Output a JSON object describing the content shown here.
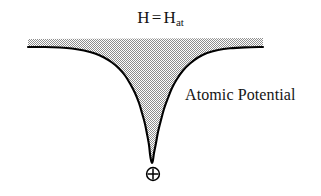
{
  "figure": {
    "title_field": {
      "lead": "H",
      "equals": "=",
      "symbol": "H",
      "subscript": "at",
      "full_text": "H = H(at)"
    },
    "annotation": {
      "label": "Atomic Potential"
    },
    "nucleus": {
      "glyph_name": "circled-plus",
      "glyph": "⊕",
      "meaning": "positive nucleus"
    },
    "colors": {
      "background": "#ffffff",
      "curve_stroke": "#000000",
      "fill_pattern": "#9a9a9a",
      "text": "#141414"
    }
  },
  "chart_data": {
    "type": "area",
    "xlabel": "",
    "ylabel": "",
    "annotations": [
      {
        "text": "Atomic Potential",
        "x": 185,
        "y": 95
      },
      {
        "text": "⊕",
        "x": 152,
        "y": 174
      }
    ],
    "grid": false,
    "legend": null,
    "xlim": [
      28,
      263
    ],
    "ylim": [
      163,
      38
    ],
    "baseline_y": 47,
    "well_center_x": 152,
    "well_bottom_y": 163,
    "series": [
      {
        "name": "atomic-potential-well",
        "description": "Coulomb-like potential well, flat asymptote at H = H_at with a deep singular well centered on the nucleus",
        "fill": true,
        "points": [
          [
            28,
            47
          ],
          [
            45,
            47
          ],
          [
            60,
            47.5
          ],
          [
            72,
            48.5
          ],
          [
            84,
            50.5
          ],
          [
            95,
            53.5
          ],
          [
            104,
            57.5
          ],
          [
            112,
            62.5
          ],
          [
            119,
            68.5
          ],
          [
            125,
            75.5
          ],
          [
            130,
            83.5
          ],
          [
            135,
            93.0
          ],
          [
            139,
            103.0
          ],
          [
            142,
            113.0
          ],
          [
            145,
            124.0
          ],
          [
            147,
            134.0
          ],
          [
            149,
            145.0
          ],
          [
            150,
            154.0
          ],
          [
            151,
            160.0
          ],
          [
            152,
            163.0
          ],
          [
            153,
            160.0
          ],
          [
            154,
            153.0
          ],
          [
            156,
            143.0
          ],
          [
            158,
            132.0
          ],
          [
            161,
            120.0
          ],
          [
            164,
            109.0
          ],
          [
            168,
            98.0
          ],
          [
            172,
            88.0
          ],
          [
            177,
            79.0
          ],
          [
            183,
            70.5
          ],
          [
            190,
            63.5
          ],
          [
            198,
            57.5
          ],
          [
            207,
            53.0
          ],
          [
            218,
            50.0
          ],
          [
            230,
            48.3
          ],
          [
            245,
            47.4
          ],
          [
            263,
            47.0
          ]
        ]
      }
    ]
  }
}
